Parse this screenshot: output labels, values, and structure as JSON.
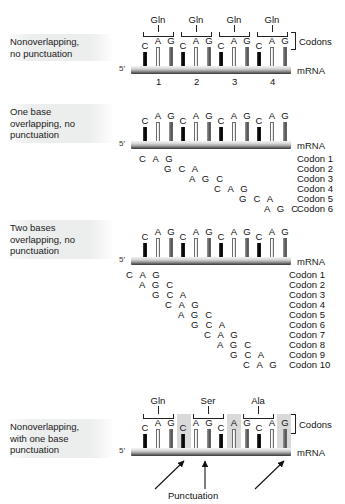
{
  "figure": {
    "mrna_label": "mRNA",
    "five_prime": "5′",
    "codons_label": "Codons",
    "punctuation_label": "Punctuation"
  },
  "sections": [
    {
      "id": "nonoverlapping-no-punctuation",
      "label_lines": [
        "Nonoverlapping,",
        "no punctuation"
      ],
      "bases": [
        "C",
        "A",
        "G",
        "C",
        "A",
        "G",
        "C",
        "A",
        "G",
        "C",
        "A",
        "G"
      ],
      "amino_acids": [
        "Gln",
        "Gln",
        "Gln",
        "Gln"
      ],
      "codon_numbers": [
        "1",
        "2",
        "3",
        "4"
      ],
      "has_brackets": true,
      "has_codons_brace": true,
      "codon_rows": []
    },
    {
      "id": "one-base-overlapping",
      "label_lines": [
        "One base",
        "overlapping, no",
        "punctuation"
      ],
      "bases": [
        "C",
        "A",
        "G",
        "C",
        "A",
        "G",
        "C",
        "A",
        "G",
        "C",
        "A",
        "G"
      ],
      "amino_acids": [],
      "codon_numbers": [],
      "has_brackets": false,
      "has_codons_brace": false,
      "codon_rows": [
        {
          "name": "Codon 1",
          "letters": "C A G",
          "offset": 0
        },
        {
          "name": "Codon 2",
          "letters": "G C A",
          "offset": 2
        },
        {
          "name": "Codon 3",
          "letters": "A G C",
          "offset": 4
        },
        {
          "name": "Codon 4",
          "letters": "C A G",
          "offset": 6
        },
        {
          "name": "Codon 5",
          "letters": "G C A",
          "offset": 8
        },
        {
          "name": "Codon 6",
          "letters": "A G C",
          "offset": 10
        }
      ]
    },
    {
      "id": "two-bases-overlapping",
      "label_lines": [
        "Two bases",
        "overlapping, no",
        "punctuation"
      ],
      "bases": [
        "C",
        "A",
        "G",
        "C",
        "A",
        "G",
        "C",
        "A",
        "G",
        "C",
        "A",
        "G"
      ],
      "amino_acids": [],
      "codon_numbers": [],
      "has_brackets": false,
      "has_codons_brace": false,
      "codon_rows": [
        {
          "name": "Codon 1",
          "letters": "C A G",
          "offset": 0
        },
        {
          "name": "Codon 2",
          "letters": "A G C",
          "offset": 1
        },
        {
          "name": "Codon 3",
          "letters": "G C A",
          "offset": 2
        },
        {
          "name": "Codon 4",
          "letters": "C A G",
          "offset": 3
        },
        {
          "name": "Codon 5",
          "letters": "A G C",
          "offset": 4
        },
        {
          "name": "Codon 6",
          "letters": "G C A",
          "offset": 5
        },
        {
          "name": "Codon 7",
          "letters": "C A G",
          "offset": 6
        },
        {
          "name": "Codon 8",
          "letters": "A G C",
          "offset": 7
        },
        {
          "name": "Codon 9",
          "letters": "G C A",
          "offset": 8
        },
        {
          "name": "Codon 10",
          "letters": "C A G",
          "offset": 9
        }
      ]
    },
    {
      "id": "nonoverlapping-with-punctuation",
      "label_lines": [
        "Nonoverlapping,",
        "with one base",
        "punctuation"
      ],
      "bases": [
        "C",
        "A",
        "G",
        "C",
        "A",
        "G",
        "C",
        "A",
        "G",
        "C",
        "A",
        "G"
      ],
      "amino_acids": [
        "Gln",
        "Ser",
        "Ala"
      ],
      "codon_numbers": [],
      "has_brackets": true,
      "has_codons_brace": true,
      "punctuation_indices": [
        3,
        7,
        11
      ],
      "codon_rows": []
    }
  ]
}
